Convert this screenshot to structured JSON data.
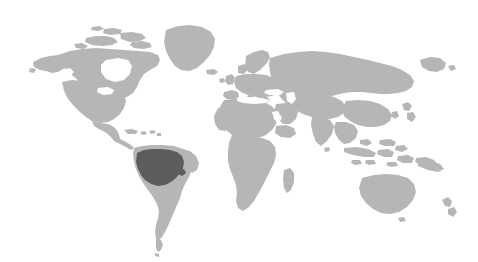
{
  "figure": {
    "type": "choropleth-world-map",
    "title": "",
    "subtitle": "",
    "caption": "",
    "width": 478,
    "height": 262,
    "background_color": "#ffffff",
    "projection": "equirectangular-style world outline",
    "has_text": false,
    "has_legend": false,
    "has_axes": false,
    "has_border": false,
    "rendering_style": "dithered halftone grayscale"
  },
  "colors": {
    "background": "#ffffff",
    "land_default": "#b6b6b6",
    "land_highlight": "#5c5c5c",
    "ocean": "#ffffff"
  },
  "legend_items": [
    {
      "label": "",
      "color": "#b6b6b6",
      "meaning": "land-default"
    },
    {
      "label": "",
      "color": "#5c5c5c",
      "meaning": "land-highlighted"
    }
  ],
  "highlight": {
    "name": "amazon-basin-northern-south-america",
    "color": "#5c5c5c",
    "approx_bounds": {
      "x": 136,
      "y": 149,
      "width": 48,
      "height": 38
    }
  },
  "landmasses": [
    {
      "name": "north-america",
      "highlighted": false
    },
    {
      "name": "greenland",
      "highlighted": false
    },
    {
      "name": "central-america",
      "highlighted": false
    },
    {
      "name": "caribbean-islands",
      "highlighted": false
    },
    {
      "name": "south-america",
      "highlighted": false
    },
    {
      "name": "amazon-basin",
      "highlighted": true
    },
    {
      "name": "europe",
      "highlighted": false
    },
    {
      "name": "africa",
      "highlighted": false
    },
    {
      "name": "madagascar",
      "highlighted": false
    },
    {
      "name": "asia",
      "highlighted": false
    },
    {
      "name": "india",
      "highlighted": false
    },
    {
      "name": "japan",
      "highlighted": false
    },
    {
      "name": "southeast-asia-islands",
      "highlighted": false
    },
    {
      "name": "australia",
      "highlighted": false
    },
    {
      "name": "new-zealand",
      "highlighted": false
    },
    {
      "name": "british-isles",
      "highlighted": false
    },
    {
      "name": "iceland",
      "highlighted": false
    }
  ]
}
